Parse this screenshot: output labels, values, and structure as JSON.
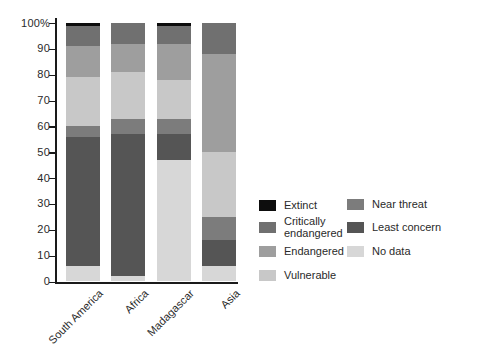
{
  "chart_data": {
    "type": "bar",
    "stacked": true,
    "title": "",
    "xlabel": "",
    "ylabel": "",
    "ylim": [
      0,
      100
    ],
    "grid": false,
    "legend_position": "right",
    "categories": [
      "South America",
      "Africa",
      "Madagascar",
      "Asia"
    ],
    "series": [
      {
        "name": "Extinct",
        "color": "#0d0d0d",
        "values": [
          1,
          0,
          1,
          0
        ]
      },
      {
        "name": "Critically endangered",
        "color": "#707070",
        "values": [
          8,
          8,
          7,
          12
        ]
      },
      {
        "name": "Endangered",
        "color": "#9e9e9e",
        "values": [
          12,
          11,
          14,
          38
        ]
      },
      {
        "name": "Vulnerable",
        "color": "#c8c8c8",
        "values": [
          19,
          18,
          15,
          25
        ]
      },
      {
        "name": "Near threat",
        "color": "#7c7c7c",
        "values": [
          4,
          6,
          6,
          9
        ]
      },
      {
        "name": "Least concern",
        "color": "#555555",
        "values": [
          50,
          55,
          10,
          10
        ]
      },
      {
        "name": "No data",
        "color": "#d7d7d7",
        "values": [
          6,
          2,
          47,
          6
        ]
      }
    ],
    "y_ticks": [
      {
        "value": 0,
        "label": "0"
      },
      {
        "value": 10,
        "label": "10"
      },
      {
        "value": 20,
        "label": "20"
      },
      {
        "value": 30,
        "label": "30"
      },
      {
        "value": 40,
        "label": "40"
      },
      {
        "value": 50,
        "label": "50"
      },
      {
        "value": 60,
        "label": "60"
      },
      {
        "value": 70,
        "label": "70"
      },
      {
        "value": 80,
        "label": "80"
      },
      {
        "value": 90,
        "label": "90"
      },
      {
        "value": 100,
        "label": "100%"
      }
    ],
    "legend_columns": [
      [
        "Extinct",
        "Critically endangered",
        "Endangered",
        "Vulnerable"
      ],
      [
        "Near threat",
        "Least concern",
        "No data"
      ]
    ]
  }
}
